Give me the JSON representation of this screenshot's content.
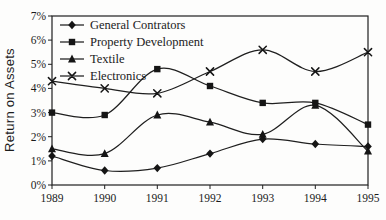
{
  "chart_data": {
    "type": "line",
    "title": "",
    "ylabel": "Return on Assets",
    "xlabel": "",
    "categories": [
      "1989",
      "1990",
      "1991",
      "1992",
      "1993",
      "1994",
      "1995"
    ],
    "y_tick_labels": [
      "0%",
      "1%",
      "2%",
      "3%",
      "4%",
      "5%",
      "6%",
      "7%"
    ],
    "ylim": [
      0,
      7
    ],
    "grid": false,
    "legend_position": "top-left-inside",
    "line_color": "#1f1f1f",
    "marker_color": "#151515",
    "background": "#fdfdfc",
    "series": [
      {
        "name": "General Contrators",
        "marker": "diamond",
        "values": [
          1.2,
          0.6,
          0.7,
          1.3,
          1.9,
          1.7,
          1.6
        ]
      },
      {
        "name": "Property Development",
        "marker": "square",
        "values": [
          3.0,
          2.9,
          4.8,
          4.1,
          3.4,
          3.4,
          2.5
        ]
      },
      {
        "name": "Textile",
        "marker": "triangle",
        "values": [
          1.5,
          1.3,
          2.9,
          2.6,
          2.1,
          3.3,
          1.4
        ]
      },
      {
        "name": "Electronics",
        "marker": "x",
        "values": [
          4.3,
          4.0,
          3.8,
          4.7,
          5.6,
          4.7,
          5.5
        ]
      }
    ]
  }
}
